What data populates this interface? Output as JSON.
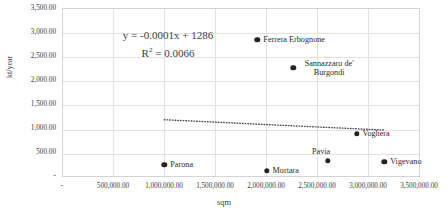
{
  "chart_data": {
    "type": "scatter",
    "title": "",
    "xlabel": "sqm",
    "ylabel": "kt/year",
    "xlim": [
      0,
      3500000
    ],
    "ylim": [
      0,
      3500000
    ],
    "y_axis_max_value": 3500,
    "grid": true,
    "legend": "none",
    "x_tick_labels": [
      "-",
      "500,000.00",
      "1,000,000.00",
      "1,500,000.00",
      "2,000,000.00",
      "2,500,000.00",
      "3,000,000.00",
      "3,500,000.00"
    ],
    "y_tick_labels": [
      "-",
      "500.00",
      "1,000.00",
      "1,500.00",
      "2,000.00",
      "2,500.00",
      "3,000.00",
      "3,500.00"
    ],
    "points": [
      {
        "label": "Parona",
        "x": 1000000,
        "y": 250,
        "label_pos": "right"
      },
      {
        "label": "Mortara",
        "x": 2000000,
        "y": 125,
        "label_pos": "right"
      },
      {
        "label": "Pavia",
        "x": 2600000,
        "y": 330,
        "label_pos": "above"
      },
      {
        "label": "Vigevano",
        "x": 3150000,
        "y": 310,
        "label_pos": "right"
      },
      {
        "label": "Voghera",
        "x": 2880000,
        "y": 890,
        "label_pos": "right"
      },
      {
        "label": "Sannazzaro de' Burgondi",
        "x": 2260000,
        "y": 2260,
        "label_pos": "right-two-line"
      },
      {
        "label": "Ferrera Erbognone",
        "x": 1910000,
        "y": 2840,
        "label_pos": "right"
      }
    ],
    "trendline": {
      "type": "linear-dotted",
      "slope": -0.0001,
      "intercept": 1286,
      "x_start": 1000000,
      "x_end": 3150000,
      "y_start": 1186,
      "y_end": 971
    },
    "annotations": {
      "equation": "y = -0.0001x + 1286",
      "r_squared_prefix": "R",
      "r_squared_sup": "2",
      "r_squared_value": "= 0.0066"
    },
    "colors": {
      "marker": "#232323",
      "gridline": "#e2e2e2",
      "plot_border": "#d4d4d4",
      "text": "#2b2b2b",
      "background": "#ffffff"
    }
  }
}
